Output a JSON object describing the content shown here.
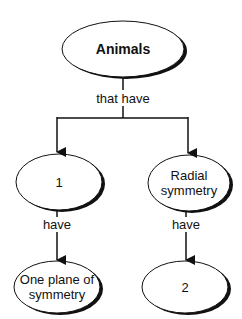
{
  "diagram": {
    "type": "concept-map",
    "nodes": {
      "root": {
        "label": "Animals"
      },
      "left": {
        "label": "1"
      },
      "right": {
        "label": "Radial symmetry"
      },
      "left_child": {
        "label": "One plane of symmetry"
      },
      "right_child": {
        "label": "2"
      }
    },
    "links": {
      "root_to_children": "that have",
      "left_to_child": "have",
      "right_to_child": "have"
    },
    "colors": {
      "stroke": "#111111",
      "fill": "#ffffff"
    }
  }
}
